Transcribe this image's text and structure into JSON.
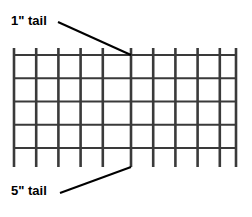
{
  "diagram": {
    "type": "wire-mesh-tail-diagram",
    "background_color": "#ffffff",
    "line_color": "#3a3a3a",
    "leader_color": "#000000",
    "text_color": "#000000",
    "annotations": {
      "top_label": "1\" tail",
      "bottom_label": "5\" tail"
    },
    "grid": {
      "vertical_wire_count": 11,
      "horizontal_wire_count": 5,
      "columns": 10,
      "rows": 4,
      "left_x": 14,
      "right_x": 236,
      "top_y": 55,
      "bottom_y": 148,
      "vertical_spacing": 22.2,
      "horizontal_spacing": 23.25,
      "top_tail_length": 7,
      "bottom_tail_length": 19,
      "vertical_x_positions": [
        14,
        36.2,
        58.4,
        80.6,
        102.8,
        131,
        153.2,
        175.4,
        197.6,
        219.8,
        236
      ],
      "horizontal_y_positions": [
        55,
        78.25,
        101.5,
        124.75,
        148
      ],
      "thick_line_width": 2.6,
      "thin_line_width": 1.3
    },
    "leaders": {
      "top": {
        "from_x": 58,
        "from_y": 22,
        "to_x": 131,
        "to_y": 55
      },
      "bottom": {
        "from_x": 60,
        "from_y": 193,
        "to_x": 131,
        "to_y": 167
      }
    }
  }
}
